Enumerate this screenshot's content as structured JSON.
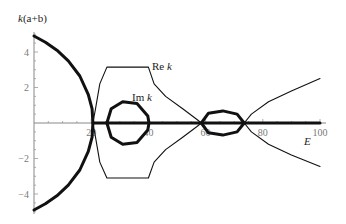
{
  "chart_data": {
    "type": "line",
    "title": "",
    "xlabel": "E",
    "ylabel": "k(a+b)",
    "xlim": [
      0,
      102
    ],
    "ylim": [
      -5.2,
      5.2
    ],
    "xticks": [
      20,
      40,
      60,
      80,
      100
    ],
    "xtick_labels": [
      "20",
      "40",
      "60",
      "80",
      "100"
    ],
    "yticks": [
      -4,
      -2,
      2,
      4
    ],
    "ytick_labels": [
      "−4",
      "−2",
      "2",
      "4"
    ],
    "grid": false,
    "legend": null,
    "annotations": [
      {
        "text_main": "Re ",
        "text_italic": "k",
        "x": 43,
        "y": 3.3
      },
      {
        "text_main": "Im ",
        "text_italic": "k",
        "x": 35,
        "y": 1.5
      }
    ],
    "series": [
      {
        "name": "Im k (outer band, E<20.6)",
        "style": "thick",
        "points": [
          [
            0,
            4.9
          ],
          [
            4,
            4.55
          ],
          [
            8,
            4.1
          ],
          [
            12,
            3.5
          ],
          [
            16,
            2.65
          ],
          [
            19,
            1.6
          ],
          [
            20.3,
            0.8
          ],
          [
            20.6,
            0
          ],
          [
            20.3,
            -0.8
          ],
          [
            19,
            -1.6
          ],
          [
            16,
            -2.65
          ],
          [
            12,
            -3.5
          ],
          [
            8,
            -4.1
          ],
          [
            4,
            -4.55
          ],
          [
            0,
            -4.9
          ]
        ]
      },
      {
        "name": "Re k upper",
        "style": "thin",
        "points": [
          [
            20.6,
            0
          ],
          [
            21.5,
            0.8
          ],
          [
            23,
            2.2
          ],
          [
            25.5,
            3.15
          ],
          [
            40,
            3.15
          ],
          [
            42,
            2.2
          ],
          [
            46,
            1.5
          ],
          [
            52,
            0.8
          ],
          [
            57,
            0.2
          ],
          [
            58.5,
            0
          ]
        ]
      },
      {
        "name": "Re k lower",
        "style": "thin",
        "points": [
          [
            20.6,
            0
          ],
          [
            21.5,
            -0.8
          ],
          [
            23,
            -2.2
          ],
          [
            25.5,
            -3.1
          ],
          [
            40,
            -3.1
          ],
          [
            42,
            -2.2
          ],
          [
            46,
            -1.5
          ],
          [
            52,
            -0.8
          ],
          [
            57,
            -0.2
          ],
          [
            58.5,
            0
          ]
        ]
      },
      {
        "name": "Im k loop 1",
        "style": "thick",
        "points": [
          [
            25.5,
            0
          ],
          [
            27,
            0.8
          ],
          [
            31,
            1.2
          ],
          [
            36,
            1.1
          ],
          [
            39.8,
            0.4
          ],
          [
            40.2,
            0
          ],
          [
            39.8,
            -0.4
          ],
          [
            36,
            -1.1
          ],
          [
            31,
            -1.2
          ],
          [
            27,
            -0.8
          ],
          [
            25.5,
            0
          ]
        ]
      },
      {
        "name": "Im k loop 2",
        "style": "thick",
        "points": [
          [
            58.5,
            0
          ],
          [
            61,
            0.55
          ],
          [
            66,
            0.68
          ],
          [
            71,
            0.5
          ],
          [
            73.5,
            0
          ],
          [
            71,
            -0.5
          ],
          [
            66,
            -0.68
          ],
          [
            61,
            -0.55
          ],
          [
            58.5,
            0
          ]
        ]
      },
      {
        "name": "Re k upper (E>73.5)",
        "style": "thin",
        "points": [
          [
            73.5,
            0
          ],
          [
            76,
            0.5
          ],
          [
            82,
            1.2
          ],
          [
            90,
            1.8
          ],
          [
            100,
            2.5
          ]
        ]
      },
      {
        "name": "Re k lower (E>73.5)",
        "style": "thin",
        "points": [
          [
            73.5,
            0
          ],
          [
            76,
            -0.5
          ],
          [
            82,
            -1.2
          ],
          [
            90,
            -1.8
          ],
          [
            100,
            -2.45
          ]
        ]
      },
      {
        "name": "Zero line (thick)",
        "style": "thick",
        "points": [
          [
            20.6,
            0
          ],
          [
            100,
            0
          ]
        ]
      }
    ]
  },
  "labels": {
    "ylabel_k": "k",
    "ylabel_rest": "(a+b)",
    "xlabel": "E",
    "re_main": "Re ",
    "re_italic": "k",
    "im_main": "Im ",
    "im_italic": "k"
  }
}
